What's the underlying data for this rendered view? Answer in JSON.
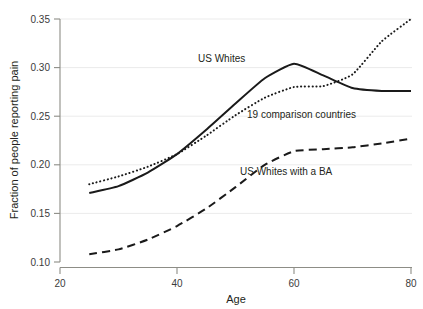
{
  "chart_data": {
    "type": "line",
    "title": "",
    "xlabel": "Age",
    "ylabel": "Fraction of people reporting pain",
    "xlim": [
      20,
      80
    ],
    "ylim": [
      0.1,
      0.35
    ],
    "xticks": [
      20,
      40,
      60,
      80
    ],
    "xtick_labels": [
      "20",
      "40",
      "60",
      "80"
    ],
    "yticks": [
      0.1,
      0.15,
      0.2,
      0.25,
      0.3,
      0.35
    ],
    "ytick_labels": [
      "0.10",
      "0.15",
      "0.20",
      "0.25",
      "0.30",
      "0.35"
    ],
    "grid": "horizontal",
    "legend_position": "inline-annotations",
    "x": [
      25,
      30,
      35,
      40,
      45,
      50,
      55,
      60,
      65,
      70,
      75,
      80
    ],
    "series": [
      {
        "name": "US Whites",
        "style": "solid",
        "color": "#1a1a1a",
        "values": [
          0.171,
          0.178,
          0.192,
          0.211,
          0.236,
          0.263,
          0.289,
          0.304,
          0.292,
          0.279,
          0.276,
          0.276
        ]
      },
      {
        "name": "19 comparison countries",
        "style": "dotted",
        "color": "#1a1a1a",
        "values": [
          0.18,
          0.188,
          0.198,
          0.211,
          0.23,
          0.251,
          0.269,
          0.28,
          0.281,
          0.293,
          0.327,
          0.35
        ]
      },
      {
        "name": "US Whites with a BA",
        "style": "dashed",
        "color": "#1a1a1a",
        "values": [
          0.108,
          0.113,
          0.123,
          0.137,
          0.155,
          0.177,
          0.2,
          0.214,
          0.216,
          0.218,
          0.222,
          0.227
        ]
      }
    ],
    "annotations": [
      {
        "text": "US Whites",
        "x": 57,
        "y": 0.318
      },
      {
        "text": "19 comparison countries",
        "x": 60,
        "y": 0.263
      },
      {
        "text": "US Whites with a BA",
        "x": 55,
        "y": 0.205
      }
    ]
  },
  "axis": {
    "xlabel": "Age",
    "ylabel": "Fraction of people reporting pain"
  },
  "yticks": {
    "t0": "0.10",
    "t1": "0.15",
    "t2": "0.20",
    "t3": "0.25",
    "t4": "0.30",
    "t5": "0.35"
  },
  "xticks": {
    "t0": "20",
    "t1": "40",
    "t2": "60",
    "t3": "80"
  },
  "labels": {
    "us_whites": "US Whites",
    "comparison": "19 comparison countries",
    "ba": "US Whites with a BA"
  }
}
